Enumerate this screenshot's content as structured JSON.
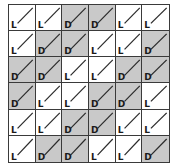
{
  "grid": {
    "rows": 6,
    "cols": 6,
    "colors": {
      "L": "#ffffff",
      "D": "#c9c9c9",
      "line": "#3a3a3a"
    },
    "cells": [
      [
        "L",
        "L",
        "D",
        "D",
        "L",
        "L"
      ],
      [
        "L",
        "D",
        "D",
        "L",
        "L",
        "D"
      ],
      [
        "D",
        "D",
        "L",
        "L",
        "D",
        "D"
      ],
      [
        "D",
        "L",
        "L",
        "D",
        "D",
        "L"
      ],
      [
        "L",
        "L",
        "D",
        "D",
        "L",
        "L"
      ],
      [
        "L",
        "D",
        "D",
        "L",
        "L",
        "D"
      ]
    ]
  }
}
